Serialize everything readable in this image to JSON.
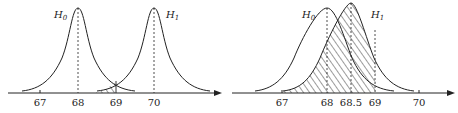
{
  "panels": [
    {
      "id": "left",
      "curves": [
        {
          "name": "H0",
          "label": "H",
          "sub": "0",
          "mean": 68
        },
        {
          "name": "H1",
          "label": "H",
          "sub": "1",
          "mean": 70
        }
      ],
      "ticks": [
        "67",
        "68",
        "69",
        "70"
      ],
      "shaded_region": "overlap between 68.6 and 69 under H1 left tail"
    },
    {
      "id": "right",
      "curves": [
        {
          "name": "H0",
          "label": "H",
          "sub": "0",
          "mean": 68
        },
        {
          "name": "H1",
          "label": "H",
          "sub": "1",
          "mean": 68.5
        }
      ],
      "ticks": [
        "67",
        "68",
        "68.5",
        "69",
        "70"
      ],
      "shaded_region": "area under H1 left of 69"
    }
  ],
  "colors": {
    "line": "#222222",
    "background": "#ffffff"
  }
}
